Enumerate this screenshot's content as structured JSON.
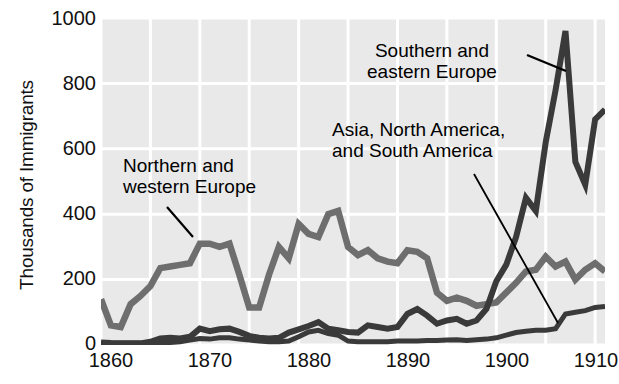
{
  "chart_data": {
    "type": "line",
    "title": "",
    "xlabel": "",
    "ylabel": "Thousands of Immigrants",
    "xlim": [
      1860,
      1911
    ],
    "ylim": [
      0,
      1000
    ],
    "grid": true,
    "legend_position": "inline-annotations",
    "x_ticks": [
      1860,
      1870,
      1880,
      1890,
      1900,
      1910
    ],
    "y_ticks": [
      0,
      200,
      400,
      600,
      800,
      1000
    ],
    "x": [
      1860,
      1861,
      1862,
      1863,
      1864,
      1865,
      1866,
      1867,
      1868,
      1869,
      1870,
      1871,
      1872,
      1873,
      1874,
      1875,
      1876,
      1877,
      1878,
      1879,
      1880,
      1881,
      1882,
      1883,
      1884,
      1885,
      1886,
      1887,
      1888,
      1889,
      1890,
      1891,
      1892,
      1893,
      1894,
      1895,
      1896,
      1897,
      1898,
      1899,
      1900,
      1901,
      1902,
      1903,
      1904,
      1905,
      1906,
      1907,
      1908,
      1909,
      1910,
      1911
    ],
    "series": [
      {
        "name": "Northern and western Europe",
        "color": "#6e6e6e",
        "values": [
          140,
          60,
          55,
          125,
          150,
          180,
          235,
          240,
          245,
          250,
          310,
          310,
          300,
          310,
          215,
          115,
          115,
          215,
          300,
          265,
          370,
          340,
          330,
          400,
          410,
          300,
          275,
          290,
          265,
          255,
          250,
          290,
          285,
          265,
          160,
          135,
          145,
          135,
          120,
          125,
          130,
          160,
          190,
          225,
          230,
          270,
          240,
          255,
          200,
          230,
          250,
          225
        ]
      },
      {
        "name": "Southern and eastern Europe",
        "color": "#3a3a3a",
        "values": [
          8,
          6,
          5,
          5,
          5,
          10,
          20,
          22,
          20,
          25,
          50,
          42,
          48,
          50,
          40,
          28,
          22,
          20,
          22,
          38,
          48,
          58,
          70,
          50,
          45,
          40,
          38,
          60,
          55,
          50,
          55,
          95,
          110,
          90,
          65,
          75,
          80,
          65,
          75,
          110,
          195,
          245,
          330,
          450,
          410,
          620,
          780,
          960,
          560,
          490,
          690,
          720
        ]
      },
      {
        "name": "Asia, North America, and South America",
        "color": "#3a3a3a",
        "values": [
          5,
          5,
          5,
          5,
          5,
          5,
          7,
          8,
          10,
          15,
          20,
          18,
          22,
          22,
          18,
          15,
          12,
          10,
          10,
          12,
          25,
          40,
          45,
          35,
          30,
          12,
          10,
          10,
          10,
          10,
          12,
          12,
          12,
          14,
          14,
          15,
          16,
          14,
          16,
          18,
          22,
          30,
          38,
          42,
          45,
          45,
          50,
          95,
          100,
          105,
          115,
          118
        ]
      }
    ],
    "annotations": [
      {
        "id": "nw",
        "lines": [
          "Northern and",
          "western Europe"
        ],
        "target_year": 1871,
        "target_value": 345
      },
      {
        "id": "se",
        "lines": [
          "Southern and",
          "eastern Europe"
        ],
        "target_year": 1906,
        "target_value": 800
      },
      {
        "id": "asia",
        "lines": [
          "Asia, North America,",
          "and South America"
        ],
        "target_year": 1906,
        "target_value": 50
      }
    ]
  },
  "axes": {
    "y_title": "Thousands of Immigrants",
    "y_tick_labels": [
      "1000",
      "800",
      "600",
      "400",
      "200",
      "0"
    ],
    "x_tick_labels": [
      "1860",
      "1870",
      "1880",
      "1890",
      "1900",
      "1910"
    ]
  },
  "labels": {
    "nw_line1": "Northern and",
    "nw_line2": "western Europe",
    "se_line1": "Southern and",
    "se_line2": "eastern Europe",
    "asia_line1": "Asia, North America,",
    "asia_line2": "and South America"
  },
  "colors": {
    "plot_background": "#e9e9e9",
    "grid": "#ffffff",
    "series_northwest": "#6e6e6e",
    "series_southeast": "#3a3a3a",
    "series_asia": "#3a3a3a",
    "text": "#111111"
  }
}
